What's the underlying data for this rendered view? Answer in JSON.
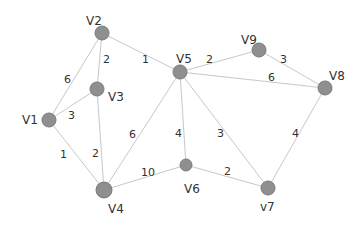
{
  "graph": {
    "type": "weighted-undirected-graph",
    "colors": {
      "node_fill": "#8f8f8f",
      "node_stroke": "#7a7a7a",
      "edge": "#c8c8c8",
      "text": "#333333",
      "background": "#ffffff"
    },
    "nodes": [
      {
        "id": "V1",
        "label": "V1",
        "x": 49,
        "y": 120,
        "r": 7,
        "lx": 22,
        "ly": 124
      },
      {
        "id": "V2",
        "label": "V2",
        "x": 102,
        "y": 33,
        "r": 7,
        "lx": 86,
        "ly": 25
      },
      {
        "id": "V3",
        "label": "V3",
        "x": 97,
        "y": 89,
        "r": 7,
        "lx": 108,
        "ly": 101
      },
      {
        "id": "V4",
        "label": "V4",
        "x": 104,
        "y": 190,
        "r": 8,
        "lx": 108,
        "ly": 213
      },
      {
        "id": "V5",
        "label": "V5",
        "x": 180,
        "y": 72,
        "r": 7,
        "lx": 176,
        "ly": 63
      },
      {
        "id": "V6",
        "label": "V6",
        "x": 186,
        "y": 165,
        "r": 6,
        "lx": 184,
        "ly": 193
      },
      {
        "id": "V7",
        "label": "v7",
        "x": 268,
        "y": 188,
        "r": 7,
        "lx": 260,
        "ly": 211
      },
      {
        "id": "V8",
        "label": "V8",
        "x": 325,
        "y": 88,
        "r": 7,
        "lx": 329,
        "ly": 80
      },
      {
        "id": "V9",
        "label": "V9",
        "x": 259,
        "y": 50,
        "r": 7,
        "lx": 241,
        "ly": 44
      }
    ],
    "edges": [
      {
        "from": "V1",
        "to": "V2",
        "weight": "6",
        "wx": 64,
        "wy": 83
      },
      {
        "from": "V1",
        "to": "V3",
        "weight": "3",
        "wx": 68,
        "wy": 119
      },
      {
        "from": "V1",
        "to": "V4",
        "weight": "1",
        "wx": 60,
        "wy": 158
      },
      {
        "from": "V2",
        "to": "V3",
        "weight": "2",
        "wx": 103,
        "wy": 63
      },
      {
        "from": "V2",
        "to": "V5",
        "weight": "1",
        "wx": 142,
        "wy": 63
      },
      {
        "from": "V3",
        "to": "V4",
        "weight": "2",
        "wx": 92,
        "wy": 157
      },
      {
        "from": "V4",
        "to": "V5",
        "weight": "6",
        "wx": 129,
        "wy": 138
      },
      {
        "from": "V4",
        "to": "V6",
        "weight": "10",
        "wx": 141,
        "wy": 176
      },
      {
        "from": "V5",
        "to": "V6",
        "weight": "4",
        "wx": 175,
        "wy": 137
      },
      {
        "from": "V5",
        "to": "V7",
        "weight": "3",
        "wx": 217,
        "wy": 137
      },
      {
        "from": "V5",
        "to": "V9",
        "weight": "2",
        "wx": 206,
        "wy": 63
      },
      {
        "from": "V5",
        "to": "V8",
        "weight": "6",
        "wx": 268,
        "wy": 81
      },
      {
        "from": "V9",
        "to": "V8",
        "weight": "3",
        "wx": 280,
        "wy": 63
      },
      {
        "from": "V6",
        "to": "V7",
        "weight": "2",
        "wx": 224,
        "wy": 175
      },
      {
        "from": "V8",
        "to": "V7",
        "weight": "4",
        "wx": 292,
        "wy": 137
      }
    ]
  }
}
